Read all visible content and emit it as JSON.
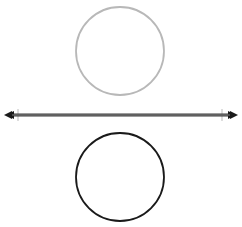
{
  "diagram": {
    "top_circle": {
      "cx": 120,
      "cy": 51,
      "r": 44,
      "stroke": "#b8b8b8",
      "stroke_width": 1.8
    },
    "axis_line": {
      "x1": 6,
      "x2": 236,
      "y": 115,
      "stroke": "#3a3a3a",
      "inner_stroke": "#9a9a9a",
      "tick_left_x": 18,
      "tick_right_x": 222,
      "tick_color": "#c8c8c8",
      "arrows": "both"
    },
    "bottom_circle": {
      "cx": 120,
      "cy": 177,
      "r": 44,
      "stroke": "#1a1a1a",
      "stroke_width": 1.8
    }
  }
}
